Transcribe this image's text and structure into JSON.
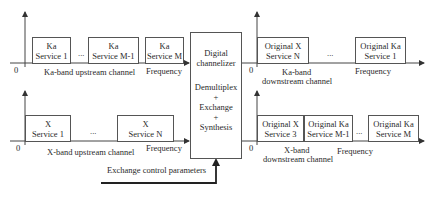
{
  "diagram": {
    "ka_upstream": {
      "origin_label": "0",
      "services": [
        {
          "line1": "Ka",
          "line2": "Service 1"
        },
        {
          "line1": "Ka",
          "line2": "Service M-1"
        },
        {
          "line1": "Ka",
          "line2": "Service M"
        }
      ],
      "ellipsis": "...",
      "channel_label": "Ka-band upstream channel",
      "axis_label": "Frequency"
    },
    "x_upstream": {
      "origin_label": "0",
      "services": [
        {
          "line1": "X",
          "line2": "Service 1"
        },
        {
          "line1": "X",
          "line2": "Service N"
        }
      ],
      "ellipsis": "...",
      "channel_label": "X-band upstream channel",
      "axis_label": "Frequency"
    },
    "channelizer": {
      "title_line1": "Digital",
      "title_line2": "channelizer",
      "step1": "Demultiplex",
      "plus1": "+",
      "step2": "Exchange",
      "plus2": "+",
      "step3": "Synthesis"
    },
    "control": {
      "label": "Exchange control parameters"
    },
    "ka_downstream": {
      "origin_label": "0",
      "services": [
        {
          "line1": "Original X",
          "line2": "Service N"
        },
        {
          "line1": "Original Ka",
          "line2": "Service 1"
        }
      ],
      "ellipsis": "...",
      "channel_label_line1": "Ka-band",
      "channel_label_line2": "downstream channel",
      "axis_label": "Frequency"
    },
    "x_downstream": {
      "origin_label": "0",
      "services": [
        {
          "line1": "Original X",
          "line2": "Service 3"
        },
        {
          "line1": "Original Ka",
          "line2": "Service M-1"
        },
        {
          "line1": "Original Ka",
          "line2": "Service M"
        }
      ],
      "ellipsis": "...",
      "channel_label_line1": "X-band",
      "channel_label_line2": "downstream channel",
      "axis_label": "Frequency"
    }
  }
}
